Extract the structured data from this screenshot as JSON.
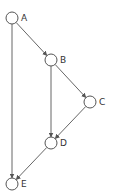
{
  "diagram": {
    "type": "directed-graph",
    "nodes": [
      {
        "id": "A",
        "label": "A",
        "x": 12,
        "y": 18
      },
      {
        "id": "B",
        "label": "B",
        "x": 51,
        "y": 60
      },
      {
        "id": "C",
        "label": "C",
        "x": 90,
        "y": 102
      },
      {
        "id": "D",
        "label": "D",
        "x": 51,
        "y": 143
      },
      {
        "id": "E",
        "label": "E",
        "x": 12,
        "y": 184
      }
    ],
    "edges": [
      {
        "from": "A",
        "to": "B"
      },
      {
        "from": "A",
        "to": "E"
      },
      {
        "from": "B",
        "to": "C"
      },
      {
        "from": "B",
        "to": "D"
      },
      {
        "from": "C",
        "to": "D"
      },
      {
        "from": "D",
        "to": "E"
      }
    ],
    "colors": {
      "stroke": "#555555",
      "label": "#333333",
      "background": "#ffffff"
    }
  }
}
